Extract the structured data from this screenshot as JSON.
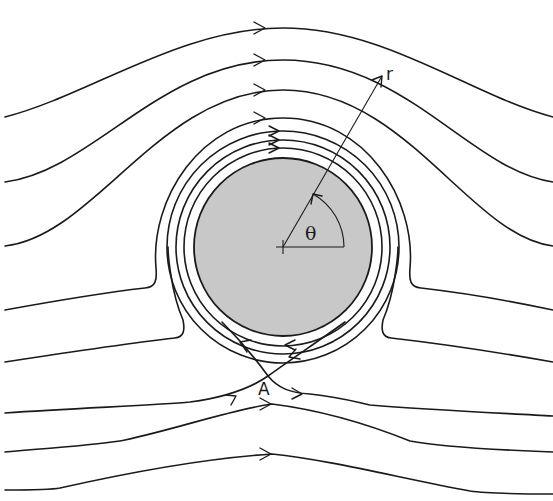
{
  "diagram": {
    "labels": {
      "radius": "r",
      "angle": "θ",
      "stagnation_point": "A"
    },
    "colors": {
      "cylinder_fill": "#c8c8c8",
      "stroke": "#1a1a1a",
      "background": "#ffffff"
    },
    "cylinder": {
      "cx": 283,
      "cy": 247,
      "r": 89
    },
    "closed_rings_radii": [
      99,
      107,
      116
    ],
    "flow_direction": "left-to-right",
    "circulation_direction": "clockwise"
  }
}
